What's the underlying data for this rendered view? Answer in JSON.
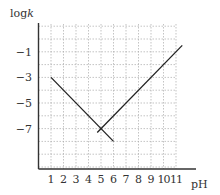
{
  "chart_data": {
    "type": "line",
    "title": "",
    "xlabel": "pH",
    "ylabel": "logk",
    "xlim": [
      0,
      11.8
    ],
    "ylim": [
      -10.2,
      1.2
    ],
    "x_ticks": [
      1,
      2,
      3,
      4,
      5,
      6,
      7,
      8,
      9,
      10,
      11
    ],
    "y_ticks": [
      -1,
      -3,
      -5,
      -7
    ],
    "grid": true,
    "grid_style": "dotted",
    "series": [
      {
        "name": "descending",
        "points": [
          [
            1,
            -3
          ],
          [
            6,
            -8
          ]
        ]
      },
      {
        "name": "ascending",
        "points": [
          [
            4.7,
            -7.3
          ],
          [
            11.5,
            -0.5
          ]
        ]
      }
    ]
  },
  "axis": {
    "x_label": "pH",
    "y_label": "logk",
    "x_tick_labels": [
      "1",
      "2",
      "3",
      "4",
      "5",
      "6",
      "7",
      "8",
      "9",
      "10",
      "11"
    ],
    "y_tick_labels": [
      "-1",
      "-3",
      "-5",
      "-7"
    ]
  }
}
